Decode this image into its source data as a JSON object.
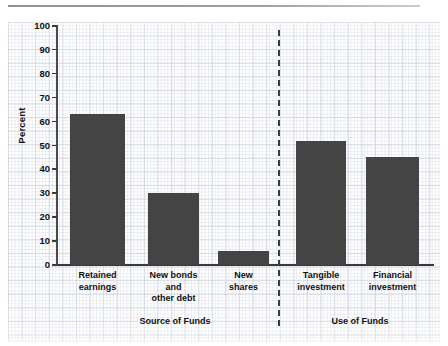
{
  "chart_data": {
    "type": "bar",
    "title": "",
    "xlabel": "",
    "ylabel": "Percent",
    "ylim": [
      0,
      100
    ],
    "grid": true,
    "legend": "none",
    "categories": [
      "Retained earnings",
      "New bonds and other debt",
      "New shares",
      "Tangible investment",
      "Financial investment"
    ],
    "category_lines": [
      [
        "Retained",
        "earnings"
      ],
      [
        "New bonds",
        "and",
        "other debt"
      ],
      [
        "New",
        "shares"
      ],
      [
        "Tangible",
        "investment"
      ],
      [
        "Financial",
        "investment"
      ]
    ],
    "values": [
      63,
      30,
      6,
      52,
      45
    ],
    "ytick_labels": [
      "100",
      "90",
      "80",
      "70",
      "60",
      "50",
      "40",
      "30",
      "20",
      "10",
      "0"
    ],
    "ytick_values": [
      100,
      90,
      80,
      70,
      60,
      50,
      40,
      30,
      20,
      10,
      0
    ],
    "groups": [
      {
        "label": "Source of Funds",
        "categories": [
          0,
          1,
          2
        ]
      },
      {
        "label": "Use of Funds",
        "categories": [
          3,
          4
        ]
      }
    ],
    "annotations": [
      {
        "type": "vertical-dashed-divider",
        "between": [
          "Source of Funds",
          "Use of Funds"
        ]
      }
    ],
    "colors": {
      "bar": "#444444",
      "axis": "#3a3a3a",
      "text": "#111111",
      "grid": "#ced4de",
      "background": "#ffffff"
    }
  }
}
